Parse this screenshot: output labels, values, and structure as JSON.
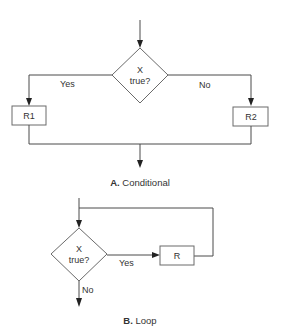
{
  "conditional": {
    "decision_line1": "X",
    "decision_line2": "true?",
    "yes_label": "Yes",
    "no_label": "No",
    "box_yes": "R1",
    "box_no": "R2",
    "caption_letter": "A.",
    "caption_text": " Conditional"
  },
  "loop": {
    "decision_line1": "X",
    "decision_line2": "true?",
    "yes_label": "Yes",
    "no_label": "No",
    "box": "R",
    "caption_letter": "B.",
    "caption_text": " Loop"
  },
  "colors": {
    "line": "#4a4a4a",
    "text": "#333333",
    "background": "#ffffff"
  }
}
